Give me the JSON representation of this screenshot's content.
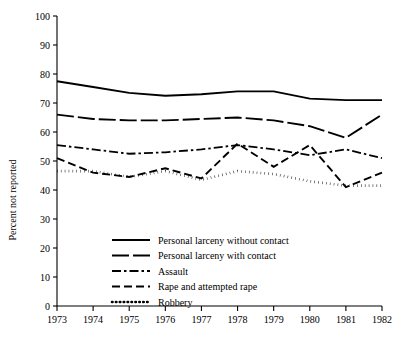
{
  "chart_data": {
    "type": "line",
    "title": "",
    "xlabel": "",
    "ylabel": "Percent not reported",
    "x": [
      1973,
      1974,
      1975,
      1976,
      1977,
      1978,
      1979,
      1980,
      1981,
      1982
    ],
    "xtick_labels": [
      "1973",
      "1974",
      "1975",
      "1976",
      "1977",
      "1978",
      "1979",
      "1980",
      "1981",
      "1982"
    ],
    "ytick_labels": [
      "0",
      "10",
      "20",
      "30",
      "40",
      "50",
      "60",
      "70",
      "80",
      "90",
      "100"
    ],
    "ytick_values": [
      0,
      10,
      20,
      30,
      40,
      50,
      60,
      70,
      80,
      90,
      100
    ],
    "ylim": [
      0,
      100
    ],
    "xlim": [
      1973,
      1982
    ],
    "grid": false,
    "legend_position": "lower-center",
    "series": [
      {
        "name": "Personal larceny without contact",
        "style": "solid",
        "values": [
          77.5,
          75.5,
          73.5,
          72.5,
          73.0,
          74.0,
          74.0,
          71.5,
          71.0,
          71.0
        ]
      },
      {
        "name": "Personal larceny with contact",
        "style": "long-dash",
        "values": [
          66.0,
          64.5,
          64.0,
          64.0,
          64.5,
          65.0,
          64.0,
          62.0,
          58.0,
          66.0
        ]
      },
      {
        "name": "Assault",
        "style": "dash-dot",
        "values": [
          55.5,
          54.0,
          52.5,
          53.0,
          54.0,
          55.5,
          54.0,
          52.0,
          54.0,
          51.0
        ]
      },
      {
        "name": "Rape and attempted rape",
        "style": "dash",
        "values": [
          51.0,
          46.0,
          44.5,
          47.5,
          44.0,
          56.0,
          48.0,
          55.5,
          41.0,
          46.0
        ]
      },
      {
        "name": "Robbery",
        "style": "dotted",
        "values": [
          46.5,
          46.5,
          44.5,
          46.5,
          43.5,
          46.5,
          45.5,
          43.0,
          41.5,
          41.5
        ]
      }
    ]
  }
}
